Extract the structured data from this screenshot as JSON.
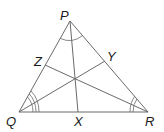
{
  "diagram": {
    "type": "triangle-angle-bisectors",
    "vertices": [
      {
        "name": "P",
        "x": 70,
        "y": 21
      },
      {
        "name": "Q",
        "x": 19,
        "y": 112
      },
      {
        "name": "R",
        "x": 148,
        "y": 112
      }
    ],
    "feet": [
      {
        "name": "X",
        "x": 78,
        "y": 112,
        "on": "QR",
        "from": "P"
      },
      {
        "name": "Y",
        "x": 105,
        "y": 61,
        "on": "PR",
        "from": "Q"
      },
      {
        "name": "Z",
        "x": 45,
        "y": 65,
        "on": "PQ",
        "from": "R"
      }
    ],
    "incenter": {
      "x": 76,
      "y": 79
    },
    "labels": {
      "P": "P",
      "Q": "Q",
      "R": "R",
      "X": "X",
      "Y": "Y",
      "Z": "Z"
    },
    "angle_marks": {
      "P": "single arc",
      "Q": "triple arc",
      "R": "double arc"
    }
  }
}
